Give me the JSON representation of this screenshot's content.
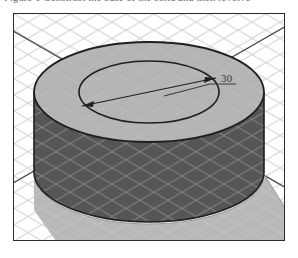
{
  "page": {
    "caption_text": "Figure 1 Construct the base of the solid and then revolve",
    "background_color": "#ffffff"
  },
  "figure": {
    "name": "isometric-cylinder-drawing",
    "frame": {
      "border_color": "#2c2c2c",
      "shadow_color": "#8e8e8e",
      "background_color": "#ffffff"
    },
    "grid": {
      "type": "isometric",
      "line_color": "#c9c9c9",
      "cell_width": 28,
      "visible": true
    },
    "solid": {
      "shape": "cylinder",
      "top_face_color": "#b4b4b4",
      "body_color": "#565656",
      "outline_color": "#1f1f1f",
      "inner_circle_color": "#b4b4b4"
    },
    "floor_shadow": {
      "color": "#b8b8b8",
      "visible": true
    },
    "dimension": {
      "label": "30",
      "type": "diameter",
      "arrow_color": "#1f1f1f",
      "leader_color": "#3b3b3b",
      "label_color": "#3b3b3b"
    },
    "axis_lines": {
      "color": "#4a4a4a",
      "count": 2
    }
  }
}
